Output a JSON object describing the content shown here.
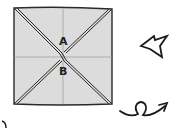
{
  "diagram": {
    "type": "origami-step",
    "paper": {
      "fill": "#dcdcdc",
      "stroke": "#2a2a2a",
      "creases": [
        "diagonal-valley-1",
        "diagonal-valley-2",
        "horizontal-crease",
        "vertical-crease"
      ]
    },
    "labels": {
      "a": "A",
      "b": "B"
    },
    "symbols": {
      "push_arrow": "push-in-arrow",
      "turn_over": "turn-over-arrow"
    },
    "colors": {
      "paper": "#dcdcdc",
      "line": "#2a2a2a",
      "crease": "#9a9a9a"
    }
  }
}
